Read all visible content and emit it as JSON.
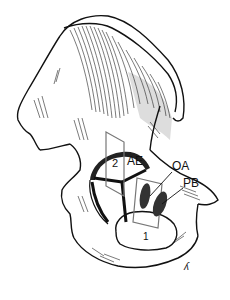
{
  "figure": {
    "labels": {
      "ae": "AE",
      "oa": "OA",
      "pb": "PB",
      "plane_1": "1",
      "plane_2": "2"
    },
    "signature": "ʎ"
  },
  "colors": {
    "ink": "#111111",
    "shading": "#c8c8c8",
    "plane_outline": "#777777",
    "background": "#ffffff"
  }
}
